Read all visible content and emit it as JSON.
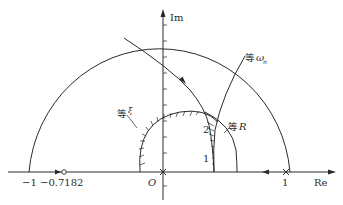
{
  "axes": {
    "x_label": "Re",
    "y_label": "Im",
    "origin_label": "O"
  },
  "ticks": {
    "minus_one": "−1",
    "zero_point": "−0.7182",
    "one": "1"
  },
  "curves": {
    "equal_omega": {
      "prefix": "等",
      "symbol": "ω",
      "subscript": "n"
    },
    "equal_R": {
      "prefix": "等",
      "symbol": "R"
    },
    "equal_xi": {
      "prefix": "等",
      "symbol": "ξ"
    }
  },
  "points": {
    "p1": "1",
    "p2": "2"
  },
  "colors": {
    "line": "#2a2a2a",
    "background": "#ffffff"
  }
}
